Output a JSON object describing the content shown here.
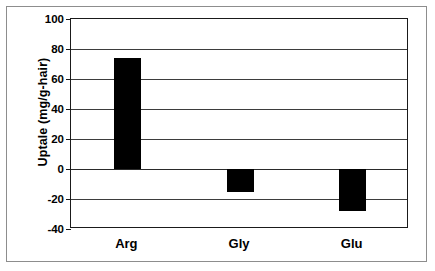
{
  "chart_data": {
    "type": "bar",
    "title": "",
    "xlabel": "",
    "ylabel": "Uptale (mg/g-hair)",
    "categories": [
      "Arg",
      "Gly",
      "Glu"
    ],
    "values": [
      74,
      -15,
      -28
    ],
    "series": [
      {
        "name": "Uptake",
        "values": [
          74,
          -15,
          -28
        ],
        "color": "#000000"
      }
    ],
    "ylim": [
      -40,
      100
    ],
    "yticks": [
      100,
      80,
      60,
      40,
      20,
      0,
      -20,
      -40
    ],
    "ytick_labels": [
      "100",
      "80",
      "60",
      "40",
      "20",
      "0",
      "-20",
      "-40"
    ],
    "grid": "horizontal",
    "legend": "none",
    "zero_line": 0
  },
  "axis": {
    "y_title": "Uptale (mg/g-hair)",
    "ticks": [
      {
        "label": "100",
        "value": 100
      },
      {
        "label": "80",
        "value": 80
      },
      {
        "label": "60",
        "value": 60
      },
      {
        "label": "40",
        "value": 40
      },
      {
        "label": "20",
        "value": 20
      },
      {
        "label": "0",
        "value": 0
      },
      {
        "label": "-20",
        "value": -20
      },
      {
        "label": "-40",
        "value": -40
      }
    ]
  },
  "bars": [
    {
      "category": "Arg",
      "value": 74
    },
    {
      "category": "Gly",
      "value": -15
    },
    {
      "category": "Glu",
      "value": -28
    }
  ]
}
